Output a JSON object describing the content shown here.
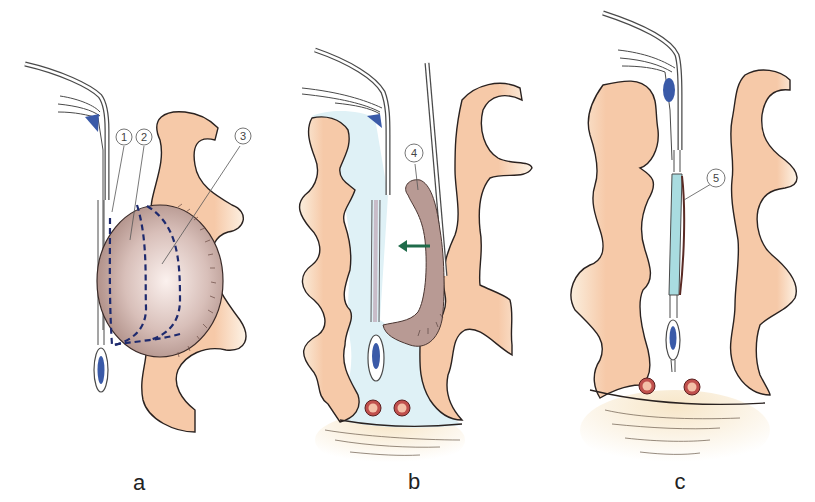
{
  "figure": {
    "panels": [
      {
        "id": "a",
        "label": "a",
        "callouts": [
          "1",
          "2",
          "3"
        ]
      },
      {
        "id": "b",
        "label": "b",
        "callouts": [
          "4"
        ]
      },
      {
        "id": "c",
        "label": "c",
        "callouts": [
          "5"
        ]
      }
    ],
    "colors": {
      "tissue": "#f6c9a8",
      "tissue_outline": "#2a2220",
      "lumen_fluid": "#dff1f6",
      "mass": "#b89a94",
      "mass_dark": "#9c7a74",
      "dashed_line": "#1e2a6e",
      "vessel_wall": "#4a4a4a",
      "blue_structure": "#3a5aa8",
      "arrow": "#1f6b4a",
      "vessel_red": "#c0504d",
      "graft": "#a9dce0",
      "base_shade": "#f8ecd6"
    }
  }
}
